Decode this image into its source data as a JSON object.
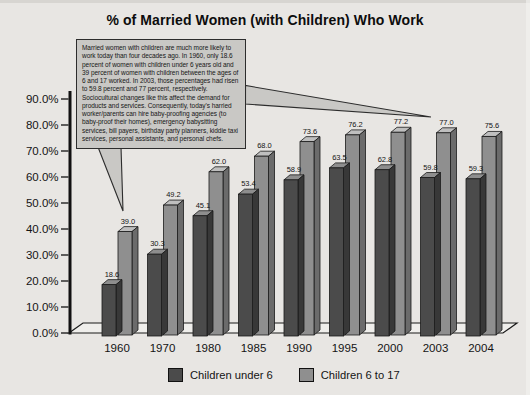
{
  "title": "% of Married Women (with Children) Who Work",
  "annotation": {
    "text": "Married women with children are much more likely to work today than four decades ago. In 1960, only 18.6 percent of women with children under 6 years old and 39 percent of women with children between the ages of 6 and 17 worked. In 2003, those percentages had risen to 59.8 percent and 77 percent, respectively. Sociocultural changes like this affect the demand for products and services. Consequently, today's harried worker/parents can hire baby-proofing agencies (to baby-proof their homes), emergency babysitting services, bill payers, birthday party planners, kiddie taxi services, personal assistants, and personal chefs."
  },
  "chart_data": {
    "type": "bar",
    "projection": "3d",
    "title": "% of Married Women (with Children) Who Work",
    "categories": [
      "1960",
      "1970",
      "1980",
      "1985",
      "1990",
      "1995",
      "2000",
      "2003",
      "2004"
    ],
    "series": [
      {
        "name": "Children under 6",
        "values": [
          18.6,
          30.3,
          45.1,
          53.4,
          58.9,
          63.5,
          62.8,
          59.8,
          59.3
        ],
        "color": "#4b4b4b",
        "color_top": "#8e8e8e",
        "color_side": "#383838"
      },
      {
        "name": "Children 6 to 17",
        "values": [
          39.0,
          49.2,
          62.0,
          68.0,
          73.6,
          76.2,
          77.2,
          77.0,
          75.6
        ],
        "color": "#8f8f8f",
        "color_top": "#bfbfbf",
        "color_side": "#6b6b6b"
      }
    ],
    "ylim": [
      0,
      90
    ],
    "ytick_step": 10,
    "yticklabels": [
      "0.0%",
      "10.0%",
      "20.0%",
      "30.0%",
      "40.0%",
      "50.0%",
      "60.0%",
      "70.0%",
      "80.0%",
      "90.0%"
    ],
    "grid": false,
    "legend_position": "bottom",
    "value_labels_shown": true
  },
  "colors": {
    "background": "#e8e6e3",
    "floor": "#efeeeb",
    "outline": "#1b1b1b",
    "axis": "#111111",
    "callout_fill": "#c9c8c5",
    "callout_border": "#2d2d2d",
    "text": "#141414"
  }
}
